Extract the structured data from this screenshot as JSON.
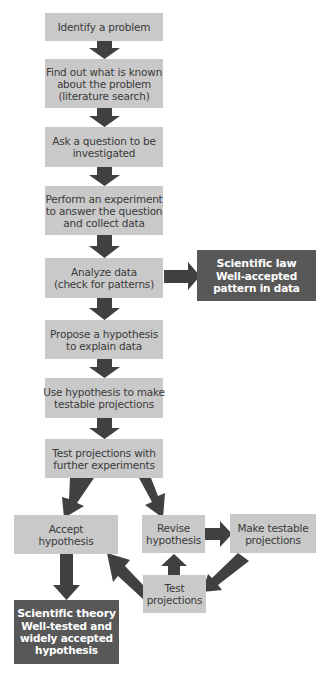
{
  "diagram": {
    "colors": {
      "step_box": "#c9c9c9",
      "result_box": "#585858",
      "arrow": "#404040",
      "text_dark": "#3a3a3a",
      "text_light": "#ffffff"
    },
    "steps": [
      {
        "id": "identify",
        "lines": [
          "Identify a problem"
        ]
      },
      {
        "id": "research",
        "lines": [
          "Find out what is known",
          "about the problem",
          "(literature search)"
        ]
      },
      {
        "id": "question",
        "lines": [
          "Ask a question to be",
          "investigated"
        ]
      },
      {
        "id": "experiment",
        "lines": [
          "Perform an experiment",
          "to answer the question",
          "and collect data"
        ]
      },
      {
        "id": "analyze",
        "lines": [
          "Analyze data",
          "(check for patterns)"
        ]
      },
      {
        "id": "propose",
        "lines": [
          "Propose a hypothesis",
          "to explain data"
        ]
      },
      {
        "id": "projections",
        "lines": [
          "Use hypothesis to make",
          "testable projections"
        ]
      },
      {
        "id": "test-further",
        "lines": [
          "Test projections with",
          "further experiments"
        ]
      },
      {
        "id": "accept",
        "lines": [
          "Accept",
          "hypothesis"
        ]
      },
      {
        "id": "revise",
        "lines": [
          "Revise",
          "hypothesis"
        ]
      },
      {
        "id": "make-testable",
        "lines": [
          "Make testable",
          "projections"
        ]
      },
      {
        "id": "test",
        "lines": [
          "Test",
          "projections"
        ]
      }
    ],
    "results": [
      {
        "id": "law",
        "title": "Scientific law",
        "lines": [
          "Well-accepted",
          "pattern in data"
        ]
      },
      {
        "id": "theory",
        "title": "Scientific theory",
        "lines": [
          "Well-tested and",
          "widely accepted",
          "hypothesis"
        ]
      }
    ],
    "connections": [
      {
        "from": "identify",
        "to": "research"
      },
      {
        "from": "research",
        "to": "question"
      },
      {
        "from": "question",
        "to": "experiment"
      },
      {
        "from": "experiment",
        "to": "analyze"
      },
      {
        "from": "analyze",
        "to": "law"
      },
      {
        "from": "analyze",
        "to": "propose"
      },
      {
        "from": "propose",
        "to": "projections"
      },
      {
        "from": "projections",
        "to": "test-further"
      },
      {
        "from": "test-further",
        "to": "accept"
      },
      {
        "from": "test-further",
        "to": "revise"
      },
      {
        "from": "revise",
        "to": "make-testable"
      },
      {
        "from": "make-testable",
        "to": "test"
      },
      {
        "from": "test",
        "to": "revise"
      },
      {
        "from": "test",
        "to": "accept"
      },
      {
        "from": "accept",
        "to": "theory"
      }
    ]
  }
}
